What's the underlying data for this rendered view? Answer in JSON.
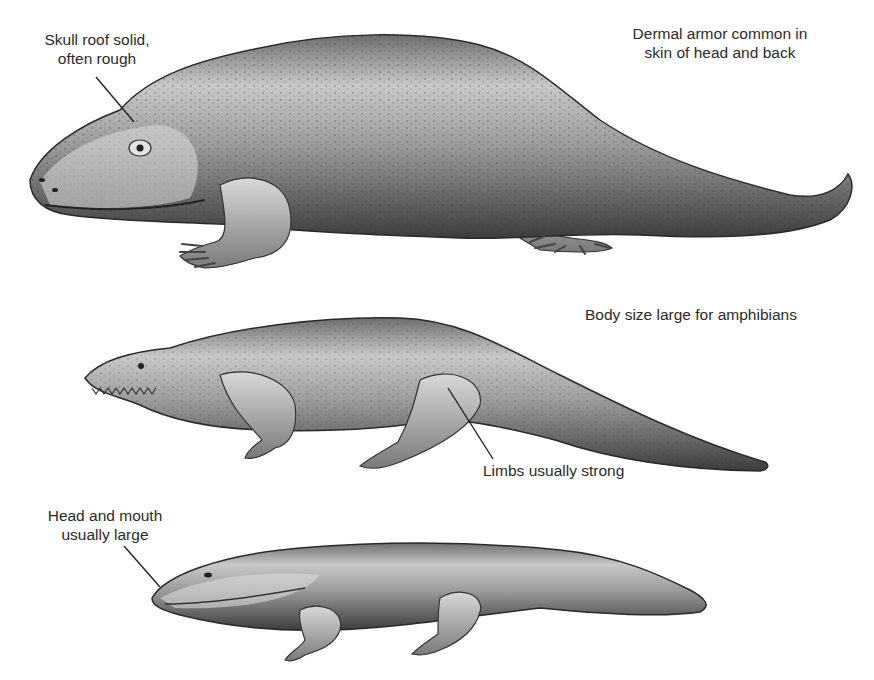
{
  "figure": {
    "title": "",
    "background": "#ffffff",
    "ink_color": "#2b2b2b"
  },
  "animals": [
    {
      "id": "top",
      "description": "Large, heavily built armored amphibian with upturned tail",
      "labels": [
        {
          "id": "skull",
          "line1": "Skull roof solid,",
          "line2": "often rough"
        },
        {
          "id": "armor",
          "line1": "Dermal armor common in",
          "line2": "skin of head and back"
        }
      ]
    },
    {
      "id": "middle",
      "description": "Long-bodied toothed amphibian with long tapering tail",
      "labels": [
        {
          "id": "size",
          "line1": "Body size large for amphibians"
        },
        {
          "id": "limbs",
          "line1": "Limbs usually strong"
        }
      ]
    },
    {
      "id": "bottom",
      "description": "Flattened salamander-like amphibian with broad head",
      "labels": [
        {
          "id": "head",
          "line1": "Head and mouth",
          "line2": "usually large"
        }
      ]
    }
  ]
}
